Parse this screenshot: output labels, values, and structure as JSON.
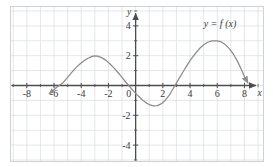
{
  "figure": {
    "name": "graph-of-y-equals-f-of-x",
    "background": "#ffffff",
    "curve_color": "#8c8c8c",
    "axis_color": "#4d4d4d",
    "grid_color": "#d9dde0",
    "border_color": "#c8ced2",
    "label_color": "#3a3a3a"
  },
  "annotations": {
    "function_label": "y = f (x)",
    "function_label_x": 6.2,
    "function_label_y": 3.9
  },
  "chart_data": {
    "type": "line",
    "title": "",
    "xlabel": "x",
    "ylabel": "y",
    "xlim": [
      -9.2,
      9.4
    ],
    "ylim": [
      -5.1,
      5.3
    ],
    "grid": true,
    "grid_step_x": 1,
    "grid_step_y": 1,
    "legend_position": "upper-right-inside",
    "xticks": [
      -8,
      -6,
      -4,
      -2,
      0,
      2,
      4,
      6,
      8
    ],
    "xtick_labels": [
      "-8",
      "-6",
      "-4",
      "-2",
      "0",
      "2",
      "4",
      "6",
      "8"
    ],
    "yticks": [
      -4,
      -2,
      2,
      4
    ],
    "ytick_labels": [
      "-4",
      "-2",
      "2",
      "4"
    ],
    "minor_tick_step": 1,
    "series": [
      {
        "name": "y = f (x)",
        "color": "#8c8c8c",
        "arrow_start": true,
        "arrow_end": true,
        "x": [
          -6.35,
          -6.1,
          -5.8,
          -5.5,
          -5.3,
          -5.0,
          -4.7,
          -4.4,
          -4.1,
          -3.8,
          -3.5,
          -3.2,
          -3.0,
          -2.8,
          -2.5,
          -2.2,
          -1.9,
          -1.6,
          -1.3,
          -1.0,
          -0.7,
          -0.4,
          -0.1,
          0.2,
          0.5,
          0.8,
          1.0,
          1.3,
          1.6,
          1.9,
          2.2,
          2.5,
          2.9,
          3.2,
          3.5,
          3.8,
          4.1,
          4.4,
          4.7,
          5.0,
          5.3,
          5.6,
          6.0,
          6.3,
          6.6,
          6.9,
          7.2,
          7.5,
          7.8,
          8.0,
          8.25
        ],
        "y": [
          -0.55,
          -0.35,
          -0.12,
          0.08,
          0.22,
          0.55,
          0.88,
          1.18,
          1.44,
          1.66,
          1.83,
          1.95,
          1.99,
          1.97,
          1.87,
          1.7,
          1.46,
          1.18,
          0.87,
          0.54,
          0.2,
          -0.12,
          -0.43,
          -0.71,
          -0.97,
          -1.18,
          -1.28,
          -1.37,
          -1.35,
          -1.22,
          -0.97,
          -0.62,
          0.02,
          0.48,
          0.94,
          1.38,
          1.8,
          2.16,
          2.48,
          2.73,
          2.9,
          2.99,
          3.0,
          2.92,
          2.74,
          2.46,
          2.08,
          1.6,
          1.02,
          0.58,
          0.18
        ]
      }
    ]
  }
}
